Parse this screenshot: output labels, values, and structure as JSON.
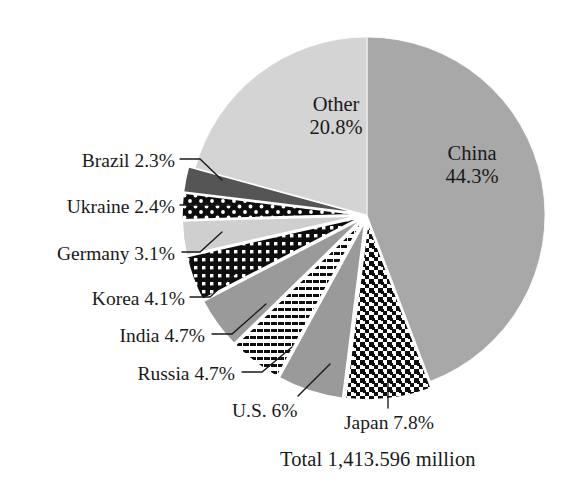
{
  "chart_data": {
    "type": "pie",
    "title": "",
    "subtitle": "",
    "xlabel": "",
    "ylabel": "",
    "legend_position": "none",
    "grid": false,
    "total_label": "Total 1,413.596 million",
    "total_value": 1413.596,
    "total_units": "million",
    "start_angle_deg": 0,
    "direction": "clockwise",
    "categories": [
      "China",
      "Japan",
      "U.S.",
      "Russia",
      "India",
      "Korea",
      "Germany",
      "Ukraine",
      "Brazil",
      "Other"
    ],
    "values": [
      44.3,
      7.8,
      6.0,
      4.7,
      4.7,
      4.1,
      3.1,
      2.4,
      2.3,
      20.8
    ],
    "slices": [
      {
        "name": "China",
        "percent": 44.3,
        "label": "China",
        "pct_label": "44.3%",
        "fill": "#a8a8a8",
        "pattern": "solid",
        "exploded": false,
        "label_place": "inside"
      },
      {
        "name": "Japan",
        "percent": 7.8,
        "label": "Japan 7.8%",
        "pct_label": "7.8%",
        "fill": "#111111",
        "pattern": "cross-check",
        "exploded": true,
        "label_place": "outside"
      },
      {
        "name": "U.S.",
        "percent": 6.0,
        "label": "U.S. 6%",
        "pct_label": "6%",
        "fill": "#9a9a9a",
        "pattern": "solid",
        "exploded": true,
        "label_place": "outside"
      },
      {
        "name": "Russia",
        "percent": 4.7,
        "label": "Russia 4.7%",
        "pct_label": "4.7%",
        "fill": "#ffffff",
        "pattern": "dashed-stripes",
        "exploded": true,
        "label_place": "outside"
      },
      {
        "name": "India",
        "percent": 4.7,
        "label": "India 4.7%",
        "pct_label": "4.7%",
        "fill": "#9a9a9a",
        "pattern": "solid",
        "exploded": true,
        "label_place": "outside"
      },
      {
        "name": "Korea",
        "percent": 4.1,
        "label": "Korea 4.1%",
        "pct_label": "4.1%",
        "fill": "#111111",
        "pattern": "white-grid-dots",
        "exploded": true,
        "label_place": "outside"
      },
      {
        "name": "Germany",
        "percent": 3.1,
        "label": "Germany 3.1%",
        "pct_label": "3.1%",
        "fill": "#cfcfcf",
        "pattern": "solid",
        "exploded": true,
        "label_place": "outside"
      },
      {
        "name": "Ukraine",
        "percent": 2.4,
        "label": "Ukraine 2.4%",
        "pct_label": "2.4%",
        "fill": "#111111",
        "pattern": "white-dots",
        "exploded": true,
        "label_place": "outside"
      },
      {
        "name": "Brazil",
        "percent": 2.3,
        "label": "Brazil 2.3%",
        "pct_label": "2.3%",
        "fill": "#555555",
        "pattern": "solid",
        "exploded": true,
        "label_place": "outside"
      },
      {
        "name": "Other",
        "percent": 20.8,
        "label": "Other",
        "pct_label": "20.8%",
        "fill": "#d4d4d4",
        "pattern": "solid",
        "exploded": false,
        "label_place": "inside"
      }
    ]
  },
  "labels": {
    "china_name": "China",
    "china_pct": "44.3%",
    "other_name": "Other",
    "other_pct": "20.8%",
    "brazil": "Brazil 2.3%",
    "ukraine": "Ukraine 2.4%",
    "germany": "Germany 3.1%",
    "korea": "Korea 4.1%",
    "india": "India 4.7%",
    "russia": "Russia 4.7%",
    "us": "U.S. 6%",
    "japan": "Japan 7.8%",
    "total": "Total 1,413.596 million"
  },
  "colors": {
    "china": "#a8a8a8",
    "other": "#d4d4d4",
    "germany": "#cfcfcf",
    "brazil": "#555555",
    "us": "#9a9a9a",
    "india": "#9a9a9a",
    "ink": "#111111",
    "background": "#ffffff",
    "leader_line": "#1a1a1a"
  }
}
